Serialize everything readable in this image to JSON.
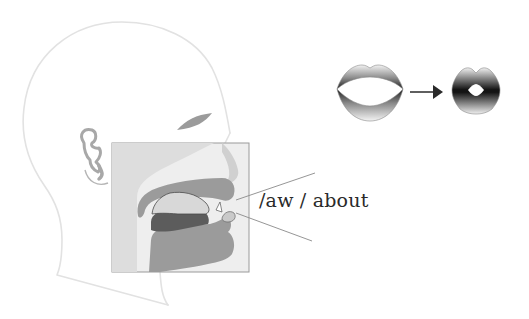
{
  "diagram": {
    "phoneme_label": "/aw / about",
    "phoneme": "/aw/",
    "example_word": "about",
    "components": {
      "head_profile": "side-view head outline",
      "ear": "ear-icon",
      "eyebrow": "eyebrow-shape",
      "cross_section": "vocal tract cross-section inset",
      "lips_start": "open-lips-icon",
      "arrow": "right-arrow-icon",
      "lips_end": "rounded-lips-icon"
    },
    "colors": {
      "outline": "#e2e2e2",
      "inset_bg": "#eeeeee",
      "inset_border": "#9a9a9a",
      "tissue": "#9b9b9b",
      "tissue_light": "#c9c9c9",
      "tongue_dark": "#5c5c5c",
      "tongue_light": "#d8d8d8",
      "pointer_line": "#8a8a8a",
      "arrow": "#2a2a2a",
      "text": "#2a2a2a"
    }
  }
}
